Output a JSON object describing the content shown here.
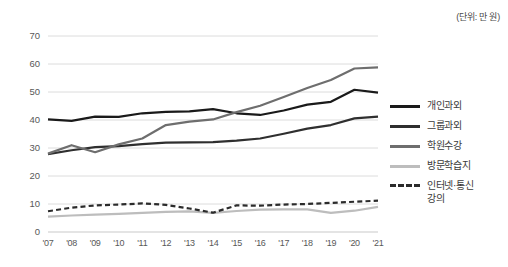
{
  "unit_note": "(단위: 만 원)",
  "legend": {
    "position": "right",
    "items": [
      {
        "label": "개인과외",
        "color": "#1a1a1a",
        "style": "solid"
      },
      {
        "label": "그룹과외",
        "color": "#2f2f2f",
        "style": "solid"
      },
      {
        "label": "학원수강",
        "color": "#6e6e6e",
        "style": "solid"
      },
      {
        "label": "방문학습지",
        "color": "#bdbdbd",
        "style": "solid"
      },
      {
        "label": "인터넷·통신\n강의",
        "color": "#2b2b2b",
        "style": "dashed"
      }
    ]
  },
  "axis": {
    "y_ticks": [
      "0",
      "10",
      "20",
      "30",
      "40",
      "50",
      "60",
      "70"
    ],
    "x_ticks": [
      "'07",
      "'08",
      "'09",
      "'10",
      "'11",
      "'12",
      "'13",
      "'14",
      "'15",
      "'16",
      "'17",
      "'18",
      "'19",
      "'20",
      "'21"
    ]
  },
  "chart_data": {
    "type": "line",
    "title": "",
    "subtitle": "",
    "xlabel": "",
    "ylabel": "",
    "unit": "(단위: 만 원)",
    "ylim": [
      0,
      70
    ],
    "ytick_step": 10,
    "grid": true,
    "legend_position": "right",
    "categories": [
      "'07",
      "'08",
      "'09",
      "'10",
      "'11",
      "'12",
      "'13",
      "'14",
      "'15",
      "'16",
      "'17",
      "'18",
      "'19",
      "'20",
      "'21"
    ],
    "series": [
      {
        "name": "개인과외",
        "color": "#1a1a1a",
        "style": "solid",
        "values": [
          40.2,
          39.7,
          41.2,
          41.1,
          42.4,
          42.9,
          43.1,
          43.9,
          42.4,
          41.8,
          43.4,
          45.5,
          46.5,
          50.8,
          49.8
        ]
      },
      {
        "name": "그룹과외",
        "color": "#2f2f2f",
        "style": "solid",
        "values": [
          27.8,
          29.2,
          30.3,
          30.7,
          31.4,
          31.9,
          32.0,
          32.1,
          32.6,
          33.4,
          35.1,
          36.9,
          38.2,
          40.6,
          41.2
        ]
      },
      {
        "name": "학원수강",
        "color": "#6e6e6e",
        "style": "solid",
        "values": [
          28.0,
          31.0,
          28.5,
          31.3,
          33.4,
          38.2,
          39.4,
          40.2,
          42.8,
          45.1,
          48.2,
          51.4,
          54.3,
          58.4,
          58.8
        ]
      },
      {
        "name": "방문학습지",
        "color": "#bdbdbd",
        "style": "solid",
        "values": [
          5.5,
          5.9,
          6.2,
          6.5,
          6.8,
          7.2,
          7.4,
          6.8,
          7.5,
          8.0,
          8.1,
          8.1,
          6.8,
          7.6,
          9.0
        ]
      },
      {
        "name": "인터넷·통신강의",
        "color": "#2b2b2b",
        "style": "dashed",
        "values": [
          7.4,
          8.7,
          9.5,
          9.8,
          10.2,
          9.7,
          8.4,
          6.9,
          9.5,
          9.4,
          9.8,
          10.0,
          10.4,
          10.8,
          11.2
        ]
      }
    ]
  }
}
